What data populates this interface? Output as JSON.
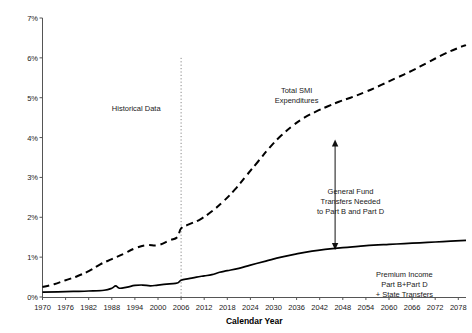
{
  "chart_data": {
    "type": "line",
    "title": "",
    "xlabel": "Calendar Year",
    "ylabel": "",
    "xlim": [
      1970,
      2080
    ],
    "ylim": [
      0,
      7
    ],
    "grid": false,
    "legend_position": "none",
    "y_unit": "percent of GDP",
    "yticks": [
      "0%",
      "1%",
      "2%",
      "3%",
      "4%",
      "5%",
      "6%",
      "7%"
    ],
    "ytick_values": [
      0,
      1,
      2,
      3,
      4,
      5,
      6,
      7
    ],
    "xticks": [
      "1970",
      "1976",
      "1982",
      "1988",
      "1994",
      "2000",
      "2006",
      "2012",
      "2018",
      "2024",
      "2030",
      "2036",
      "2042",
      "2048",
      "2054",
      "2060",
      "2066",
      "2072",
      "2078"
    ],
    "xtick_values": [
      1970,
      1976,
      1982,
      1988,
      1994,
      2000,
      2006,
      2012,
      2018,
      2024,
      2030,
      2036,
      2042,
      2048,
      2054,
      2060,
      2066,
      2072,
      2078
    ],
    "series": [
      {
        "name": "Total SMI Expenditures",
        "style": "dashed",
        "color": "#000000",
        "x": [
          1970,
          1973,
          1976,
          1979,
          1982,
          1985,
          1988,
          1991,
          1994,
          1997,
          2000,
          2003,
          2005,
          2006,
          2008,
          2011,
          2014,
          2017,
          2020,
          2023,
          2026,
          2029,
          2032,
          2035,
          2038,
          2041,
          2044,
          2047,
          2050,
          2054,
          2058,
          2062,
          2066,
          2070,
          2074,
          2078,
          2080
        ],
        "values": [
          0.25,
          0.32,
          0.42,
          0.52,
          0.65,
          0.82,
          0.95,
          1.08,
          1.22,
          1.3,
          1.3,
          1.42,
          1.5,
          1.72,
          1.82,
          1.95,
          2.15,
          2.4,
          2.7,
          3.05,
          3.4,
          3.75,
          4.05,
          4.3,
          4.5,
          4.65,
          4.78,
          4.9,
          5.0,
          5.15,
          5.32,
          5.5,
          5.68,
          5.88,
          6.08,
          6.25,
          6.32
        ]
      },
      {
        "name": "Premium Income Part B+Part D + State Transfers",
        "style": "solid",
        "color": "#000000",
        "x": [
          1970,
          1974,
          1978,
          1982,
          1986,
          1988,
          1989,
          1990,
          1992,
          1994,
          1996,
          1998,
          2000,
          2003,
          2005,
          2006,
          2008,
          2010,
          2012,
          2014,
          2016,
          2018,
          2021,
          2024,
          2028,
          2032,
          2036,
          2040,
          2044,
          2048,
          2052,
          2056,
          2060,
          2064,
          2068,
          2072,
          2076,
          2080
        ],
        "values": [
          0.12,
          0.13,
          0.14,
          0.15,
          0.17,
          0.22,
          0.28,
          0.22,
          0.25,
          0.29,
          0.3,
          0.28,
          0.3,
          0.33,
          0.35,
          0.42,
          0.46,
          0.5,
          0.53,
          0.56,
          0.62,
          0.66,
          0.72,
          0.8,
          0.9,
          1.0,
          1.08,
          1.15,
          1.2,
          1.24,
          1.27,
          1.3,
          1.32,
          1.34,
          1.36,
          1.38,
          1.4,
          1.42
        ]
      }
    ],
    "annotations": [
      {
        "id": "historical-data",
        "text": "Historical Data",
        "x": 1988,
        "y": 4.85
      },
      {
        "id": "total-smi-expenditures",
        "lines": [
          "Total SMI",
          "Expenditures"
        ],
        "x": 2036,
        "y": 5.3
      },
      {
        "id": "general-fund-transfers",
        "lines": [
          "General Fund",
          "Transfers Needed",
          "to Part B and Part D"
        ],
        "x": 2050,
        "y": 2.75
      },
      {
        "id": "premium-income",
        "lines": [
          "Premium Income",
          "Part B+Part D",
          "+ State Transfers"
        ],
        "x": 2064,
        "y": 0.68
      }
    ],
    "markers": [
      {
        "id": "projection-divider",
        "type": "vertical-dotted-line",
        "x": 2006,
        "y_from": 0,
        "y_to": 6.0
      },
      {
        "id": "gap-arrow",
        "type": "double-headed-vertical-arrow",
        "x": 2046,
        "y_from": 1.18,
        "y_to": 3.95
      }
    ]
  }
}
